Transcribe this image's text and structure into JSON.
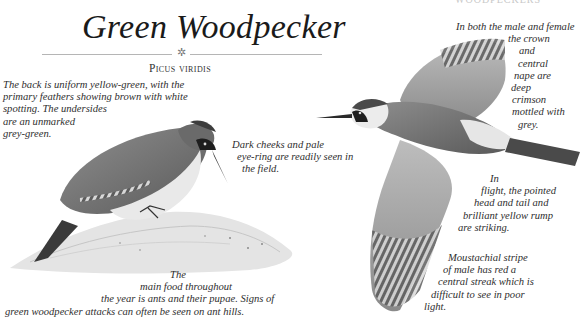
{
  "header": {
    "page_header_cut": "WOODPECKERS"
  },
  "species": {
    "common_name": "Green Woodpecker",
    "latin_name": "Picus viridis",
    "ornament_icon": "ornament-flower-icon"
  },
  "annotations": {
    "back": [
      "The back is uniform yellow-green, with the",
      "primary feathers showing brown with white",
      "spotting. The undersides",
      "are an unmarked",
      "grey-green."
    ],
    "cheeks": [
      "Dark cheeks and pale",
      "eye-ring are readily seen in",
      "the field."
    ],
    "food": [
      "The",
      "main food throughout",
      "the year is ants and their pupae. Signs of",
      "green woodpecker attacks can often be seen on ant hills."
    ],
    "crown": [
      "In both the male and female",
      "the crown",
      "and",
      "central",
      "nape are",
      "deep",
      "crimson",
      "mottled with",
      "grey."
    ],
    "flight": [
      "In",
      "flight, the pointed",
      "head and tail and",
      "brilliant yellow rump",
      "are striking."
    ],
    "moustache": [
      "Moustachial stripe",
      "of male has red a",
      "central streak which is",
      "difficult to see in poor",
      "light."
    ]
  },
  "illustrations": {
    "perched_bird": "perched-woodpecker-illustration",
    "flying_bird": "flying-woodpecker-illustration",
    "ant_hill": "ant-hill-illustration"
  },
  "colors": {
    "text": "#2e2e2e",
    "rule": "#b5b5b5",
    "background": "#ffffff"
  }
}
